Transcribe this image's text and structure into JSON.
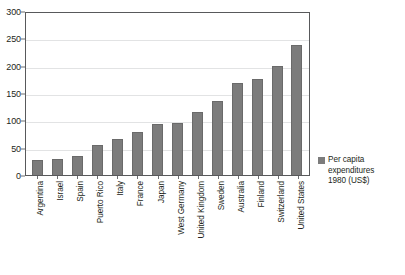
{
  "chart_data": {
    "type": "bar",
    "title": "",
    "subtitle": "",
    "xlabel": "",
    "ylabel": "",
    "ylim": [
      0,
      300
    ],
    "yticks": [
      0,
      50,
      100,
      150,
      200,
      250,
      300
    ],
    "ytick_labels": [
      "0",
      "50",
      "100",
      "150",
      "200",
      "250",
      "300"
    ],
    "grid": true,
    "orientation": "vertical",
    "legend_position": "right",
    "bar_color": "#7c7c7c",
    "axis_color": "#58595b",
    "gridline_color": "#e2e3e4",
    "categories": [
      "Argentina",
      "Israel",
      "Spain",
      "Puerto Rico",
      "Italy",
      "France",
      "Japan",
      "West Germany",
      "United Kingdom",
      "Sweden",
      "Australia",
      "Finland",
      "Switzerland",
      "United States"
    ],
    "values": [
      29,
      31,
      37,
      56,
      68,
      81,
      95,
      97,
      117,
      137,
      171,
      178,
      201,
      240
    ],
    "series": [
      {
        "name": "Per capita expenditures 1980 (US$)",
        "values": [
          29,
          31,
          37,
          56,
          68,
          81,
          95,
          97,
          117,
          137,
          171,
          178,
          201,
          240
        ]
      }
    ],
    "legend": [
      {
        "label_lines": [
          "Per capita",
          "expenditures",
          "1980 (US$)"
        ],
        "label": "Per capita expenditures 1980 (US$)",
        "color": "#7c7c7c"
      }
    ]
  }
}
